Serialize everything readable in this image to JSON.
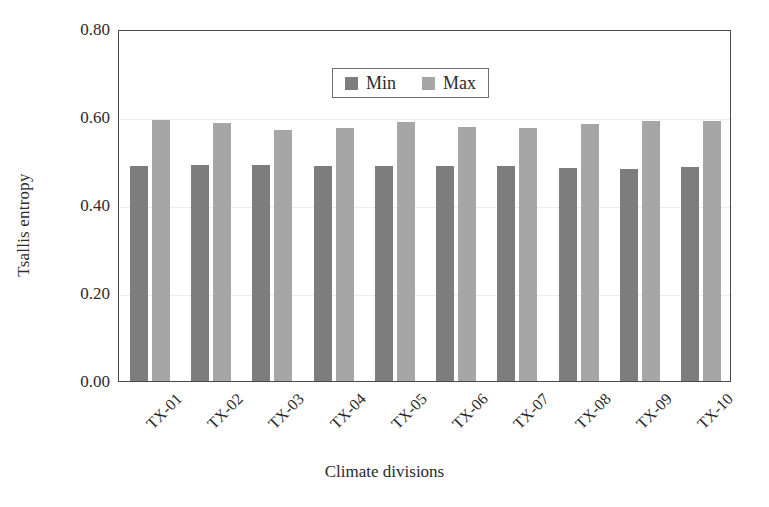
{
  "chart_data": {
    "type": "bar",
    "title": "",
    "xlabel": "Climate divisions",
    "ylabel": "Tsallis entropy",
    "categories": [
      "TX-01",
      "TX-02",
      "TX-03",
      "TX-04",
      "TX-05",
      "TX-06",
      "TX-07",
      "TX-08",
      "TX-09",
      "TX-10"
    ],
    "series": [
      {
        "name": "Min",
        "color": "#7d7d7d",
        "values": [
          0.489,
          0.49,
          0.49,
          0.489,
          0.489,
          0.489,
          0.488,
          0.485,
          0.482,
          0.486
        ]
      },
      {
        "name": "Max",
        "color": "#a6a6a6",
        "values": [
          0.594,
          0.587,
          0.57,
          0.575,
          0.589,
          0.578,
          0.576,
          0.583,
          0.591,
          0.591
        ]
      }
    ],
    "ylim": [
      0.0,
      0.8
    ],
    "ytick_labels": [
      "0.80",
      "0.60",
      "0.40",
      "0.20",
      "0.00"
    ],
    "ytick_values": [
      0.8,
      0.6,
      0.4,
      0.2,
      0.0
    ],
    "grid": true,
    "legend_position": "top-center",
    "xtick_rotation": -45
  },
  "legend": {
    "entries": [
      {
        "label": "Min",
        "color": "#7d7d7d"
      },
      {
        "label": "Max",
        "color": "#a6a6a6"
      }
    ]
  },
  "axes": {
    "y_title": "Tsallis entropy",
    "x_title": "Climate divisions"
  }
}
